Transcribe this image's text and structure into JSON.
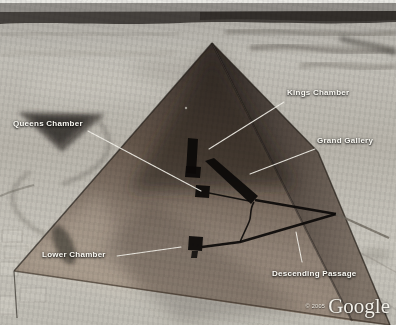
{
  "view": {
    "description": "Google Earth aerial view of the Great Pyramid with a semi-transparent 3D overlay showing interior chambers and passages"
  },
  "annotations": {
    "kings_chamber": {
      "label": "Kings Chamber"
    },
    "queens_chamber": {
      "label": "Queens Chamber"
    },
    "grand_gallery": {
      "label": "Grand Gallery"
    },
    "lower_chamber": {
      "label": "Lower Chamber"
    },
    "descending_passage": {
      "label": "Descending Passage"
    }
  },
  "attribution": {
    "copyright": "© 2005",
    "brand": "Google"
  },
  "colors": {
    "desert_light": "#c6c3bb",
    "desert_mid": "#b2afa7",
    "horizon_band": "#45413d",
    "pyramid_face_dark": "#2e2724",
    "pyramid_face_light": "#94806f",
    "chamber_model": "#0b0908",
    "leader_line": "#f4f2ea",
    "label_text": "#fbfaf4"
  }
}
